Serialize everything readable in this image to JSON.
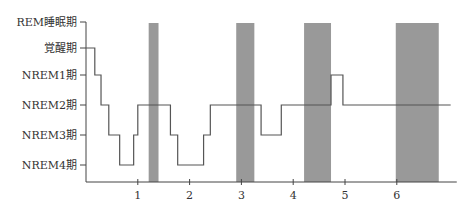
{
  "chart_data": {
    "type": "line",
    "subtype": "hypnogram (step)",
    "title": "",
    "xlabel": "",
    "ylabel": "",
    "y_categories": [
      "REM睡眠期",
      "覚醒期",
      "NREM1期",
      "NREM2期",
      "NREM3期",
      "NREM4期"
    ],
    "x_ticks": [
      1,
      2,
      3,
      4,
      5,
      6
    ],
    "xlim": [
      0,
      7.1
    ],
    "grid": false,
    "legend": null,
    "steps": [
      {
        "start": 0.0,
        "end": 0.17,
        "stage": "覚醒期"
      },
      {
        "start": 0.17,
        "end": 0.29,
        "stage": "NREM1期"
      },
      {
        "start": 0.29,
        "end": 0.44,
        "stage": "NREM2期"
      },
      {
        "start": 0.44,
        "end": 0.65,
        "stage": "NREM3期"
      },
      {
        "start": 0.65,
        "end": 0.92,
        "stage": "NREM4期"
      },
      {
        "start": 0.92,
        "end": 1.0,
        "stage": "NREM3期"
      },
      {
        "start": 1.0,
        "end": 1.63,
        "stage": "NREM2期"
      },
      {
        "start": 1.63,
        "end": 1.77,
        "stage": "NREM3期"
      },
      {
        "start": 1.77,
        "end": 2.27,
        "stage": "NREM4期"
      },
      {
        "start": 2.27,
        "end": 2.4,
        "stage": "NREM3期"
      },
      {
        "start": 2.4,
        "end": 3.38,
        "stage": "NREM2期"
      },
      {
        "start": 3.38,
        "end": 3.77,
        "stage": "NREM3期"
      },
      {
        "start": 3.77,
        "end": 4.73,
        "stage": "NREM2期"
      },
      {
        "start": 4.73,
        "end": 4.96,
        "stage": "NREM1期"
      },
      {
        "start": 4.96,
        "end": 7.04,
        "stage": "NREM2期"
      }
    ],
    "rem_periods": [
      {
        "start": 1.21,
        "end": 1.4
      },
      {
        "start": 2.9,
        "end": 3.25
      },
      {
        "start": 4.21,
        "end": 4.73
      },
      {
        "start": 5.98,
        "end": 6.81
      }
    ],
    "colors": {
      "line": "#555555",
      "rem_band": "#999999",
      "axis": "#444444"
    }
  }
}
